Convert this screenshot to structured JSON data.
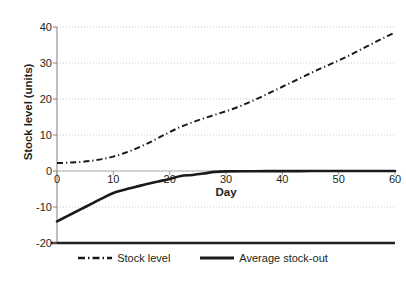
{
  "chart_data": {
    "type": "line",
    "title": "",
    "xlabel": "Day",
    "ylabel": "Stock level (units)",
    "xlim": [
      0,
      60
    ],
    "ylim": [
      -20,
      40
    ],
    "xticks": [
      0,
      10,
      20,
      30,
      40,
      50,
      60
    ],
    "yticks": [
      -20,
      -10,
      0,
      10,
      20,
      30,
      40
    ],
    "grid": "horizontal-dotted",
    "legend_position": "bottom-center",
    "background_color": "#ffffff",
    "axis_color": "#231f20",
    "grid_color": "#c9c9c9",
    "series": [
      {
        "name": "Stock level",
        "style": "dash-dot",
        "color": "#1a1a1a",
        "width": 1.6,
        "x": [
          0,
          2,
          4,
          6,
          8,
          10,
          12,
          14,
          16,
          18,
          20,
          22,
          24,
          26,
          28,
          30,
          32,
          34,
          36,
          38,
          40,
          42,
          44,
          46,
          48,
          50,
          52,
          54,
          56,
          58,
          60
        ],
        "y": [
          2.2,
          2.3,
          2.5,
          2.8,
          3.3,
          4.0,
          5.0,
          6.2,
          7.6,
          9.2,
          10.8,
          12.3,
          13.5,
          14.6,
          15.6,
          16.6,
          17.7,
          19.0,
          20.4,
          21.9,
          23.4,
          24.9,
          26.4,
          27.9,
          29.3,
          30.7,
          32.2,
          33.8,
          35.4,
          37.0,
          38.5
        ]
      },
      {
        "name": "Average stock-out",
        "style": "solid",
        "color": "#1a1a1a",
        "width": 2.6,
        "x": [
          0,
          2,
          4,
          6,
          8,
          10,
          12,
          14,
          16,
          18,
          20,
          22,
          24,
          26,
          28,
          30,
          35,
          40,
          45,
          50,
          55,
          60
        ],
        "y": [
          -14.0,
          -12.4,
          -10.8,
          -9.2,
          -7.6,
          -6.1,
          -5.2,
          -4.4,
          -3.6,
          -2.9,
          -2.2,
          -1.4,
          -1.1,
          -0.7,
          -0.25,
          -0.1,
          -0.05,
          -0.03,
          -0.02,
          -0.01,
          0.0,
          0.0
        ]
      }
    ]
  },
  "legend": {
    "items": [
      {
        "label": "Stock level",
        "style": "dash-dot"
      },
      {
        "label": "Average stock-out",
        "style": "solid"
      }
    ]
  }
}
